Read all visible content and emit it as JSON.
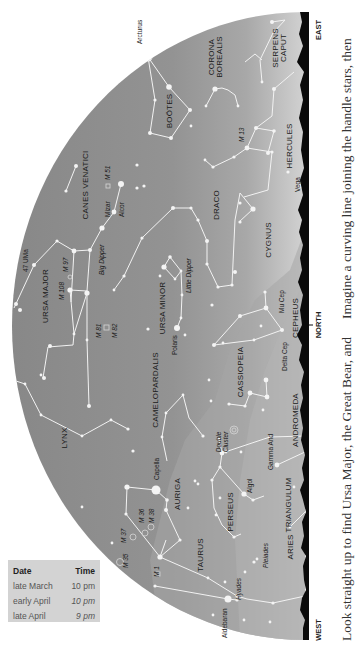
{
  "chart": {
    "directions": {
      "east": "EAST",
      "north": "NORTH",
      "west": "WEST"
    },
    "colors": {
      "sky": "#8c8c8c",
      "sky_light": "#c9c9c9",
      "horizon": "#0a0a0a",
      "lines": "#f2f2f2",
      "page": "#ffffff",
      "table_bg": "#d3d3d3"
    },
    "constellations": {
      "serpens_caput_1": "SERPENS",
      "serpens_caput_2": "CAPUT",
      "corona_borealis_1": "CORONA",
      "corona_borealis_2": "BOREALIS",
      "bootes": "BOÖTES",
      "hercules": "HERCULES",
      "canes_venatici": "CANES VENATICI",
      "draco": "DRACO",
      "cygnus": "CYGNUS",
      "ursa_major": "URSA MAJOR",
      "ursa_minor": "URSA MINOR",
      "cepheus": "CEPHEUS",
      "camelopardalis": "CAMELOPARDALIS",
      "cassiopeia": "CASSIOPEIA",
      "lynx": "LYNX",
      "andromeda": "ANDROMEDA",
      "auriga": "AURIGA",
      "perseus": "PERSEUS",
      "triangulum": "TRIANGULUM",
      "taurus": "TAURUS",
      "aries": "ARIES"
    },
    "stars": {
      "arcturus": "Arcturus",
      "vega": "Vega",
      "mizar": "Mizar",
      "alcor": "Alcor",
      "uma47": "47 UMa",
      "big_dipper": "Big Dipper",
      "little_dipper": "Little Dipper",
      "polaris": "Polaris",
      "mu_cep": "Mu Cep",
      "delta_cep": "Delta Cep",
      "capella": "Capella",
      "double_cluster_1": "Double",
      "double_cluster_2": "Cluster",
      "gamma_and": "Gamma And",
      "algol": "Algol",
      "hyades": "Hyades",
      "pleiades": "Pleiades",
      "aldebaran": "Aldebaran"
    },
    "objects": {
      "m13": "M 13",
      "m51": "M 51",
      "m97": "M 97",
      "m108": "M 108",
      "m81": "M 81",
      "m82": "M 82",
      "m36": "M 36",
      "m38": "M 38",
      "m37": "M 37",
      "m35": "M 35",
      "m1": "M 1"
    }
  },
  "table": {
    "headers": {
      "date": "Date",
      "time": "Time"
    },
    "rows": [
      {
        "date": "late March",
        "time": "10 pm"
      },
      {
        "date": "early April",
        "time": "10 pm"
      },
      {
        "date": "late April",
        "time": "9 pm"
      }
    ]
  },
  "text": {
    "line1": "Look straight up to find Ursa Major, the Great Bear, and",
    "line2": "Imagine a curving line joining the handle stars, then"
  }
}
